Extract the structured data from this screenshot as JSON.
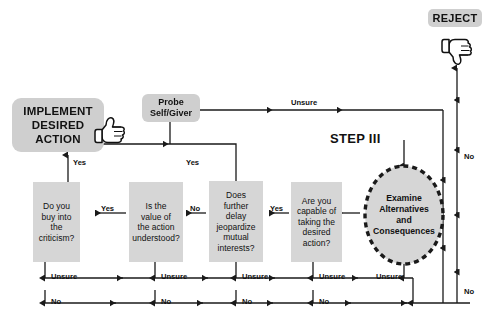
{
  "diagram": {
    "title": "STEP III",
    "step_label": "STEP III"
  },
  "terminals": {
    "implement": {
      "label_lines": [
        "IMPLEMENT",
        "DESIRED",
        "ACTION"
      ],
      "line1": "IMPLEMENT",
      "line2": "DESIRED",
      "line3": "ACTION",
      "icon": "thumbs-up-icon"
    },
    "reject": {
      "label": "REJECT",
      "icon": "thumbs-down-icon"
    },
    "probe": {
      "line1": "Probe",
      "line2": "Self/Giver"
    }
  },
  "start_node": {
    "line1": "Examine",
    "line2": "Alternatives",
    "line3": "and",
    "line4": "Consequences"
  },
  "decisions": [
    {
      "id": "buy-into-criticism",
      "lines": [
        "Do you",
        "buy into",
        "the",
        "criticism?"
      ],
      "line1": "Do you",
      "line2": "buy into",
      "line3": "the",
      "line4": "criticism?"
    },
    {
      "id": "value-understood",
      "lines": [
        "Is the",
        "value of",
        "the action",
        "understood?"
      ],
      "line1": "Is the",
      "line2": "value of",
      "line3": "the action",
      "line4": "understood?"
    },
    {
      "id": "delay-jeopardize",
      "lines": [
        "Does",
        "further",
        "delay",
        "jeopardize",
        "mutual",
        "interests?"
      ],
      "line1": "Does",
      "line2": "further",
      "line3": "delay",
      "line4": "jeopardize",
      "line5": "mutual",
      "line6": "interests?"
    },
    {
      "id": "capable-of-taking",
      "lines": [
        "Are you",
        "capable of",
        "taking the",
        "desired",
        "action?"
      ],
      "line1": "Are you",
      "line2": "capable of",
      "line3": "taking the",
      "line4": "desired",
      "line5": "action?"
    }
  ],
  "edge_labels": {
    "unsure_top": "Unsure",
    "yes_to_implement": "Yes",
    "yes_box3_up": "Yes",
    "yes_b2_to_b1": "Yes",
    "no_b3_to_b2": "No",
    "yes_b4_to_b3": "Yes",
    "unsure_1": "Unsure",
    "unsure_2": "Unsure",
    "unsure_3": "Unsure",
    "unsure_4": "Unsure",
    "unsure_5": "Unsure",
    "no_1": "No",
    "no_2": "No",
    "no_3": "No",
    "no_4": "No",
    "no_right_upper": "No",
    "no_right_lower": "No"
  },
  "colors": {
    "box_fill": "#d6d6d6",
    "terminal_fill": "#cfcfcf",
    "line": "#1a1a1a",
    "text": "#111111",
    "background": "#ffffff"
  }
}
